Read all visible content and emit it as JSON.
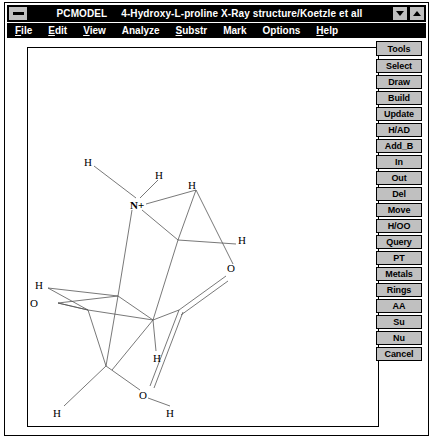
{
  "window": {
    "sysmenu_icon": "system-menu-icon",
    "title_app": "PCMODEL",
    "title_doc": "4-Hydroxy-L-proline X-Ray structure/Koetzle et all",
    "minimize_label": "▼",
    "maximize_label": "▲"
  },
  "menubar": {
    "items": [
      {
        "label": "File",
        "mnemonic": "F"
      },
      {
        "label": "Edit",
        "mnemonic": "E"
      },
      {
        "label": "View",
        "mnemonic": "V"
      },
      {
        "label": "Analyze",
        "mnemonic": "A"
      },
      {
        "label": "Substr",
        "mnemonic": "S"
      },
      {
        "label": "Mark",
        "mnemonic": "M"
      },
      {
        "label": "Options",
        "mnemonic": "O"
      },
      {
        "label": "Help",
        "mnemonic": "H"
      }
    ]
  },
  "tools": {
    "header": "Tools",
    "buttons": [
      {
        "label": "Select"
      },
      {
        "label": "Draw"
      },
      {
        "label": "Build"
      },
      {
        "label": "Update"
      },
      {
        "label": "H/AD"
      },
      {
        "label": "Add_B"
      },
      {
        "label": "In"
      },
      {
        "label": "Out"
      },
      {
        "label": "Del"
      },
      {
        "label": "Move"
      },
      {
        "label": "H/OO"
      },
      {
        "label": "Query"
      },
      {
        "label": "PT"
      },
      {
        "label": "Metals"
      },
      {
        "label": "Rings"
      },
      {
        "label": "AA"
      },
      {
        "label": "Su"
      },
      {
        "label": "Nu"
      },
      {
        "label": "Cancel"
      }
    ]
  },
  "molecule": {
    "name": "4-Hydroxy-L-proline",
    "atom_labels": [
      {
        "text": "H",
        "x": 56,
        "y": 113
      },
      {
        "text": "H",
        "x": 127,
        "y": 126
      },
      {
        "text": "H",
        "x": 160,
        "y": 136
      },
      {
        "text": "N+",
        "x": 105,
        "y": 156
      },
      {
        "text": "H",
        "x": 210,
        "y": 191
      },
      {
        "text": "O",
        "x": 202,
        "y": 219
      },
      {
        "text": "H",
        "x": 7,
        "y": 236
      },
      {
        "text": "O",
        "x": 2,
        "y": 254
      },
      {
        "text": "H",
        "x": 125,
        "y": 309
      },
      {
        "text": "O",
        "x": 113,
        "y": 346
      },
      {
        "text": "H",
        "x": 25,
        "y": 364
      },
      {
        "text": "H",
        "x": 138,
        "y": 364
      }
    ],
    "bond_color": "#555555",
    "label_color": "#000000"
  },
  "colors": {
    "titlebar_bg": "#000000",
    "titlebar_fg": "#ffffff",
    "menubar_bg": "#000000",
    "menubar_fg": "#ffffff",
    "button_face": "#c0c0c0",
    "canvas_bg": "#ffffff",
    "frame": "#000000"
  }
}
